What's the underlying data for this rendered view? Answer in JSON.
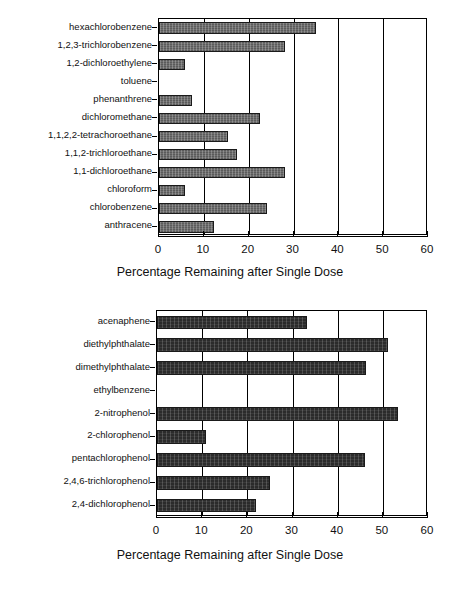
{
  "figure": {
    "background": "#ffffff",
    "axis_color": "#000000"
  },
  "charts": [
    {
      "id": "top",
      "axis_title": "Percentage Remaining after Single Dose",
      "bar_color": "#6f6f6f",
      "xticks": [
        "0",
        "10",
        "20",
        "30",
        "40",
        "50",
        "60"
      ],
      "categories": [
        "hexachlorobenzene",
        "1,2,3-trichlorobenzene",
        "1,2-dichloroethylene",
        "toluene",
        "phenanthrene",
        "dichloromethane",
        "1,1,2,2-tetrachoroethane",
        "1,1,2-trichloroethane",
        "1,1-dichloroethane",
        "chloroform",
        "chlorobenzene",
        "anthracene"
      ],
      "values": [
        35,
        28.2,
        5.7,
        0,
        7.4,
        22.5,
        15.5,
        17.5,
        28,
        5.8,
        24.2,
        12.2
      ]
    },
    {
      "id": "bottom",
      "axis_title": "Percentage Remaining after Single Dose",
      "bar_color": "#2b2b2b",
      "xticks": [
        "0",
        "10",
        "20",
        "30",
        "40",
        "50",
        "60"
      ],
      "categories": [
        "acenaphene",
        "diethylphthalate",
        "dimethylphthalate",
        "ethylbenzene",
        "2-nitrophenol",
        "2-chlorophenol",
        "pentachlorophenol",
        "2,4,6-trichlorophenol",
        "2,4-dichlorophenol"
      ],
      "values": [
        33.2,
        51.2,
        46.2,
        0,
        53.3,
        10.8,
        46,
        25,
        22
      ]
    }
  ],
  "chart_data": [
    {
      "type": "bar",
      "orientation": "horizontal",
      "title": "",
      "subtitle": "",
      "xlabel": "Percentage Remaining after Single Dose",
      "ylabel": "",
      "xlim": [
        0,
        60
      ],
      "xticks": [
        0,
        10,
        20,
        30,
        40,
        50,
        60
      ],
      "grid": "vertical",
      "legend": "none",
      "bar_color": "#6f6f6f",
      "categories": [
        "hexachlorobenzene",
        "1,2,3-trichlorobenzene",
        "1,2-dichloroethylene",
        "toluene",
        "phenanthrene",
        "dichloromethane",
        "1,1,2,2-tetrachoroethane",
        "1,1,2-trichloroethane",
        "1,1-dichloroethane",
        "chloroform",
        "chlorobenzene",
        "anthracene"
      ],
      "values": [
        35,
        28.2,
        5.7,
        0,
        7.4,
        22.5,
        15.5,
        17.5,
        28,
        5.8,
        24.2,
        12.2
      ]
    },
    {
      "type": "bar",
      "orientation": "horizontal",
      "title": "",
      "subtitle": "",
      "xlabel": "Percentage Remaining after Single Dose",
      "ylabel": "",
      "xlim": [
        0,
        60
      ],
      "xticks": [
        0,
        10,
        20,
        30,
        40,
        50,
        60
      ],
      "grid": "vertical",
      "legend": "none",
      "bar_color": "#2b2b2b",
      "categories": [
        "acenaphene",
        "diethylphthalate",
        "dimethylphthalate",
        "ethylbenzene",
        "2-nitrophenol",
        "2-chlorophenol",
        "pentachlorophenol",
        "2,4,6-trichlorophenol",
        "2,4-dichlorophenol"
      ],
      "values": [
        33.2,
        51.2,
        46.2,
        0,
        53.3,
        10.8,
        46,
        25,
        22
      ]
    }
  ]
}
